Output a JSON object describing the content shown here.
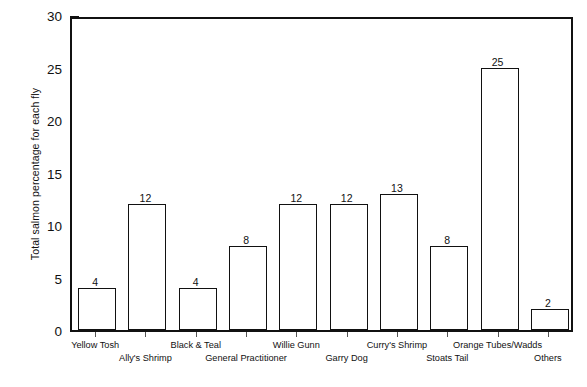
{
  "chart_data": {
    "type": "bar",
    "title": "",
    "xlabel": "",
    "ylabel": "Total salmon percentage for each fly",
    "ylim": [
      0,
      30
    ],
    "yticks": [
      0,
      5,
      10,
      15,
      20,
      25,
      30
    ],
    "ytick_labels": [
      "0",
      "5",
      "10",
      "15",
      "20",
      "25",
      "30"
    ],
    "grid": false,
    "legend": "none",
    "categories": [
      "Yellow Tosh",
      "Ally's Shrimp",
      "Black & Teal",
      "General Practitioner",
      "Willie Gunn",
      "Garry Dog",
      "Curry's Shrimp",
      "Stoats Tail",
      "Orange Tubes/Wadds",
      "Others"
    ],
    "values": [
      4,
      12,
      4,
      8,
      12,
      12,
      13,
      8,
      25,
      2
    ],
    "data_labels": [
      "4",
      "12",
      "4",
      "8",
      "12",
      "12",
      "13",
      "8",
      "25",
      "2"
    ],
    "bar_style": {
      "fill": "#ffffff",
      "edge": "#111111"
    }
  },
  "axis": {
    "y_title": "Total salmon percentage for each fly",
    "tick_labels": [
      "30",
      "25",
      "20",
      "15",
      "10",
      "5",
      "0"
    ]
  },
  "xaxis": {
    "labels": [
      {
        "text": "Yellow Tosh",
        "row": "a"
      },
      {
        "text": "Ally's Shrimp",
        "row": "b"
      },
      {
        "text": "Black & Teal",
        "row": "a"
      },
      {
        "text": "General Practitioner",
        "row": "b"
      },
      {
        "text": "Willie Gunn",
        "row": "a"
      },
      {
        "text": "Garry Dog",
        "row": "b"
      },
      {
        "text": "Curry's Shrimp",
        "row": "a"
      },
      {
        "text": "Stoats Tail",
        "row": "b"
      },
      {
        "text": "Orange Tubes/Wadds",
        "row": "a"
      },
      {
        "text": "Others",
        "row": "b"
      }
    ]
  },
  "colors": {
    "ink": "#111111",
    "background": "#ffffff"
  }
}
